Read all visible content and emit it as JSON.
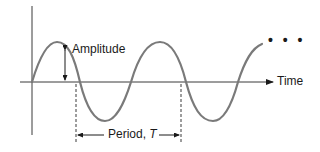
{
  "diagram": {
    "type": "sine-wave",
    "labels": {
      "amplitude": "Amplitude",
      "time_axis": "Time",
      "period_prefix": "Period, ",
      "period_symbol": "T",
      "continuation": "• • •"
    },
    "colors": {
      "wave": "#7a7a7a",
      "axes": "#3a3a3a",
      "annotations": "#1a1a1a",
      "background": "#ffffff"
    },
    "geometry": {
      "origin": [
        32,
        82
      ],
      "amplitude_px": 40,
      "period_px": 105,
      "period_markers_x": [
        76,
        181
      ]
    }
  }
}
